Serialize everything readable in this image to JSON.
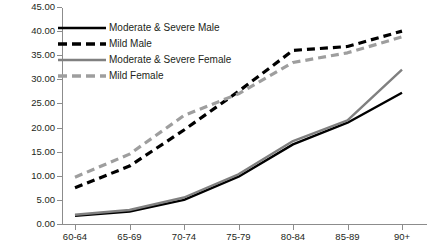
{
  "chart_data": {
    "type": "line",
    "title": "",
    "xlabel": "",
    "ylabel": "",
    "categories": [
      "60-64",
      "65-69",
      "70-74",
      "75-79",
      "80-84",
      "85-89",
      "90+"
    ],
    "ylim": [
      0,
      45
    ],
    "ytick_labels": [
      "0.00",
      "5.00",
      "10.00",
      "15.00",
      "20.00",
      "25.00",
      "30.00",
      "35.00",
      "40.00",
      "45.00"
    ],
    "ytick_values": [
      0,
      5,
      10,
      15,
      20,
      25,
      30,
      35,
      40,
      45
    ],
    "grid": false,
    "legend_position": "upper-left-inside",
    "series": [
      {
        "name": "Moderate & Severe Male",
        "style": "solid",
        "color": "#000000",
        "values": [
          1.7,
          2.6,
          5.0,
          9.8,
          16.5,
          21.0,
          27.2
        ]
      },
      {
        "name": "Mild Male",
        "style": "dashed",
        "color": "#000000",
        "values": [
          7.5,
          12.0,
          19.5,
          27.5,
          36.0,
          36.8,
          40.0
        ]
      },
      {
        "name": "Moderate & Severe Female",
        "style": "solid",
        "color": "#808080",
        "values": [
          1.9,
          2.9,
          5.5,
          10.3,
          17.2,
          21.5,
          32.0
        ]
      },
      {
        "name": "Mild Female",
        "style": "dashed",
        "color": "#9e9e9e",
        "values": [
          9.7,
          14.5,
          22.5,
          27.0,
          33.5,
          35.5,
          38.8
        ]
      }
    ]
  },
  "legend": {
    "items": [
      {
        "label": "Moderate & Severe Male"
      },
      {
        "label": "Mild Male"
      },
      {
        "label": "Moderate & Severe Female"
      },
      {
        "label": "Mild Female"
      }
    ]
  },
  "colors": {
    "axis": "#8c8c8c",
    "text": "#231f20",
    "background": "#ffffff",
    "male_solid": "#000000",
    "male_dashed": "#000000",
    "female_solid": "#808080",
    "female_dashed": "#9e9e9e"
  }
}
